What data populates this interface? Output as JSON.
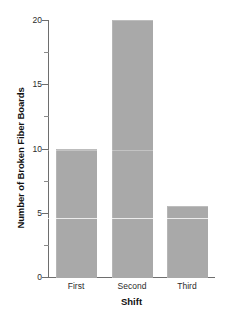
{
  "chart_data": {
    "type": "bar",
    "title": "",
    "xlabel": "Shift",
    "ylabel": "Number of Broken Fiber Boards",
    "categories": [
      "First",
      "Second",
      "Third"
    ],
    "values": [
      10,
      20,
      5.5
    ],
    "ylim": [
      0,
      20
    ],
    "yticks": [
      0,
      5,
      10,
      15,
      20
    ],
    "ytick_labels": [
      "0",
      "5",
      "10",
      "15",
      "20"
    ],
    "yminor_ticks": [
      2.5,
      7.5,
      12.5,
      17.5
    ],
    "grid": false,
    "legend": null,
    "bar_color": "#a9a9a9",
    "axis_color": "#6e6e6e",
    "background": "#ffffff"
  },
  "axes": {
    "y_title": "Number of Broken Fiber Boards",
    "x_title": "Shift"
  },
  "ticks": {
    "y": [
      {
        "label": "20",
        "value": 20
      },
      {
        "label": "15",
        "value": 15
      },
      {
        "label": "10",
        "value": 10
      },
      {
        "label": "5",
        "value": 5
      },
      {
        "label": "0",
        "value": 0
      }
    ],
    "x": [
      {
        "label": "First"
      },
      {
        "label": "Second"
      },
      {
        "label": "Third"
      }
    ]
  }
}
